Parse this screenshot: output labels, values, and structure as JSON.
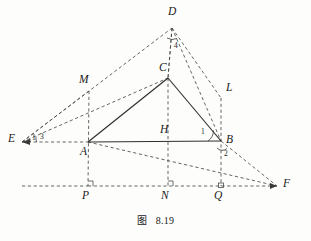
{
  "figure": {
    "caption_label": "图",
    "caption_number": "8.19",
    "background_color": "#fdfdfb",
    "stroke_color": "#3a3a3a",
    "solid_color": "#333333"
  },
  "points": [
    {
      "id": "D",
      "label": "D",
      "x": 172,
      "y": 28,
      "lx": 168,
      "ly": 6
    },
    {
      "id": "C",
      "label": "C",
      "x": 168,
      "y": 78,
      "lx": 159,
      "ly": 62
    },
    {
      "id": "M",
      "label": "M",
      "x": 89,
      "y": 91,
      "lx": 79,
      "ly": 74
    },
    {
      "id": "L",
      "label": "L",
      "x": 221,
      "y": 98,
      "lx": 226,
      "ly": 82
    },
    {
      "id": "E",
      "label": "E",
      "x": 22,
      "y": 142,
      "lx": 8,
      "ly": 133
    },
    {
      "id": "H",
      "label": "H",
      "x": 168,
      "y": 142,
      "lx": 160,
      "ly": 124
    },
    {
      "id": "B",
      "label": "B",
      "x": 221,
      "y": 141,
      "lx": 226,
      "ly": 134
    },
    {
      "id": "A",
      "label": "A",
      "x": 88,
      "y": 142,
      "lx": 80,
      "ly": 146
    },
    {
      "id": "P",
      "label": "P",
      "x": 88,
      "y": 186,
      "lx": 82,
      "ly": 190
    },
    {
      "id": "N",
      "label": "N",
      "x": 168,
      "y": 186,
      "lx": 161,
      "ly": 190
    },
    {
      "id": "Q",
      "label": "Q",
      "x": 221,
      "y": 186,
      "lx": 214,
      "ly": 190
    },
    {
      "id": "F",
      "label": "F",
      "x": 277,
      "y": 186,
      "lx": 283,
      "ly": 178
    }
  ],
  "angle_labels": [
    {
      "id": "angle-1-at-B",
      "label": "1",
      "x": 201,
      "y": 131
    },
    {
      "id": "angle-2-at-B",
      "label": "2",
      "x": 224,
      "y": 152
    },
    {
      "id": "angle-3-at-E",
      "label": "3",
      "x": 40,
      "y": 135
    },
    {
      "id": "angle-1-at-E",
      "label": "1",
      "x": 32,
      "y": 136
    },
    {
      "id": "angle-4-at-D",
      "label": "4",
      "x": 174,
      "y": 45
    }
  ],
  "solid_segments": [
    {
      "name": "segment-A-C",
      "from": "A",
      "to": "C"
    },
    {
      "name": "segment-C-B",
      "from": "C",
      "to": "B"
    },
    {
      "name": "segment-A-B",
      "from": "A",
      "to": "B"
    }
  ],
  "dashed_segments": [
    {
      "name": "segment-E-D",
      "from": "E",
      "to": "D"
    },
    {
      "name": "segment-E-C",
      "from": "E",
      "to": "C"
    },
    {
      "name": "segment-E-A",
      "from": "E",
      "to": "A"
    },
    {
      "name": "segment-D-C",
      "from": "D",
      "to": "C"
    },
    {
      "name": "segment-D-B",
      "from": "D",
      "to": "B"
    },
    {
      "name": "segment-D-L",
      "from": "D",
      "to": "L"
    },
    {
      "name": "segment-C-N",
      "from": "C",
      "to": "N"
    },
    {
      "name": "segment-M-P",
      "from": "M",
      "to": "P"
    },
    {
      "name": "segment-L-Q",
      "from": "L",
      "to": "Q"
    },
    {
      "name": "segment-A-F",
      "from": "A",
      "to": "F"
    },
    {
      "name": "segment-B-F",
      "from": "B",
      "to": "F"
    },
    {
      "name": "segment-P-F",
      "from": "P",
      "to": "F"
    },
    {
      "name": "segment-E-P",
      "from": "E",
      "to": "P"
    }
  ],
  "right_angle_marks": [
    {
      "name": "right-angle-at-P",
      "x": 88,
      "y": 186
    },
    {
      "name": "right-angle-at-N",
      "x": 168,
      "y": 186
    },
    {
      "name": "right-angle-at-Q",
      "x": 221,
      "y": 186
    }
  ]
}
